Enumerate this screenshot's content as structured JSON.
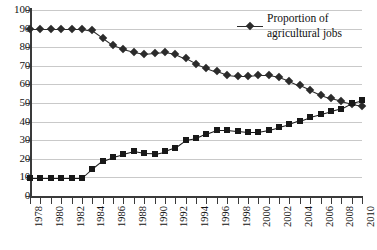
{
  "chart_data": {
    "type": "line",
    "title": "",
    "xlabel": "",
    "ylabel": "",
    "ylim": [
      0,
      100
    ],
    "ytick_step": 10,
    "yticks": [
      100,
      90,
      80,
      70,
      60,
      50,
      40,
      30,
      20,
      10,
      0
    ],
    "xlim": [
      1978,
      2010
    ],
    "x": [
      1978,
      1979,
      1980,
      1981,
      1982,
      1983,
      1984,
      1985,
      1986,
      1987,
      1988,
      1989,
      1990,
      1991,
      1992,
      1993,
      1994,
      1995,
      1996,
      1997,
      1998,
      1999,
      2000,
      2001,
      2002,
      2003,
      2004,
      2005,
      2006,
      2007,
      2008,
      2009,
      2010
    ],
    "xtick_labels": [
      "1978",
      "1980",
      "1982",
      "1984",
      "1986",
      "1988",
      "1990",
      "1992",
      "1994",
      "1996",
      "1998",
      "2000",
      "2002",
      "2004",
      "2006",
      "2008",
      "2010"
    ],
    "xtick_label_years": [
      1978,
      1980,
      1982,
      1984,
      1986,
      1988,
      1990,
      1992,
      1994,
      1996,
      1998,
      2000,
      2002,
      2004,
      2006,
      2008,
      2010
    ],
    "grid": true,
    "grid_axis": "y",
    "legend_position": "top-right",
    "series": [
      {
        "name": "Proportion of agricultural jobs",
        "marker": "diamond",
        "color": "#2b2b2b",
        "values": [
          90,
          90,
          90,
          90,
          90,
          90,
          89,
          85,
          81,
          79,
          77.5,
          76.5,
          77,
          77.5,
          76.5,
          74,
          71,
          69,
          67,
          65,
          64.5,
          64.5,
          65,
          65,
          64,
          62,
          59.5,
          57,
          54.5,
          52.5,
          51,
          49.5,
          48.5
        ]
      },
      {
        "name": "Series 2",
        "marker": "square",
        "color": "#181818",
        "values": [
          9.5,
          9.5,
          9.5,
          9.5,
          9.5,
          9.5,
          14.5,
          19,
          21,
          22.5,
          24,
          23,
          22.8,
          24,
          26,
          30,
          31,
          33.5,
          35.5,
          35.5,
          35,
          34.5,
          34.5,
          35.5,
          37,
          38.5,
          40.5,
          42.5,
          44,
          45.5,
          47,
          50,
          51.5
        ]
      }
    ]
  },
  "legend": {
    "label": "Proportion of\nagricultural jobs",
    "marker_icon": "diamond-marker-icon"
  },
  "caption": {
    "text": ""
  }
}
